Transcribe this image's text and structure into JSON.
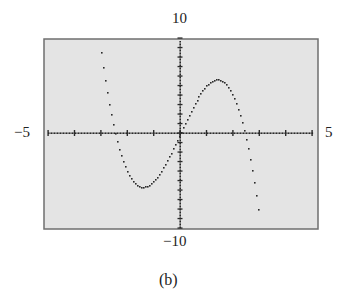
{
  "chart_data": {
    "type": "scatter",
    "title": "",
    "caption": "(b)",
    "function": "y = -x^3 + 6x",
    "xlabel": "",
    "ylabel": "",
    "xlim": [
      -5,
      5
    ],
    "ylim": [
      -10,
      10
    ],
    "xscale_ticks": 1,
    "yscale_ticks": 1,
    "grid": false,
    "window_labels": {
      "xmin": "−5",
      "xmax": "5",
      "ymin": "−10",
      "ymax": "10"
    },
    "x": [
      -3.0,
      -2.8,
      -2.6,
      -2.4,
      -2.2,
      -2.0,
      -1.8,
      -1.6,
      -1.4,
      -1.2,
      -1.0,
      -0.8,
      -0.6,
      -0.4,
      -0.2,
      0.0,
      0.2,
      0.4,
      0.6,
      0.8,
      1.0,
      1.2,
      1.4,
      1.6,
      1.8,
      2.0,
      2.2,
      2.4,
      2.6,
      2.8,
      3.0
    ],
    "y": [
      9.0,
      5.15,
      1.98,
      -0.58,
      -2.55,
      -4.0,
      -4.97,
      -5.5,
      -5.66,
      -5.47,
      -5.0,
      -4.29,
      -3.38,
      -2.34,
      -1.19,
      0.0,
      1.19,
      2.34,
      3.38,
      4.29,
      5.0,
      5.47,
      5.66,
      5.5,
      4.97,
      4.0,
      2.55,
      0.58,
      -1.98,
      -5.15,
      -9.0
    ],
    "key_points": {
      "local_max": [
        1.41,
        5.66
      ],
      "local_min": [
        -1.41,
        -5.66
      ],
      "zeros": [
        -2.45,
        0,
        2.45
      ]
    },
    "colors": {
      "background": "#e4e4e4",
      "frame": "#6f6f6f",
      "points": "#2a2a2a"
    }
  },
  "labels": {
    "top": "10",
    "bottom": "−10",
    "left": "−5",
    "right": "5",
    "caption": "(b)"
  }
}
